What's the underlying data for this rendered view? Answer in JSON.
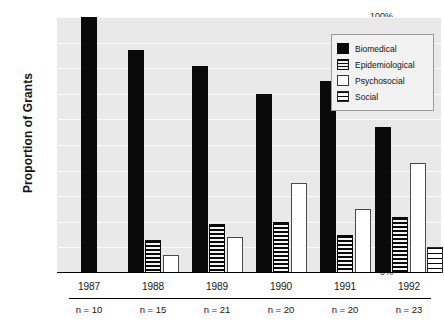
{
  "chart_data": {
    "type": "bar",
    "title": "",
    "subtitle": "",
    "xlabel": "",
    "ylabel": "Proportion of Grants",
    "ylim": [
      0,
      100
    ],
    "yticks": [
      "0%",
      "10%",
      "20%",
      "30%",
      "40%",
      "50%",
      "60%",
      "70%",
      "80%",
      "90%",
      "100%"
    ],
    "ytick_values": [
      0,
      10,
      20,
      30,
      40,
      50,
      60,
      70,
      80,
      90,
      100
    ],
    "grid": true,
    "legend_position": "top-right",
    "categories": [
      "1987",
      "1988",
      "1989",
      "1990",
      "1991",
      "1992"
    ],
    "group_annotations": [
      "n = 10",
      "n = 15",
      "n = 21",
      "n = 20",
      "n = 20",
      "n = 23"
    ],
    "series": [
      {
        "name": "Biomedical",
        "pattern": "solid-black",
        "color": "#0a0a0a",
        "values": [
          100,
          87,
          81,
          70,
          75,
          57
        ]
      },
      {
        "name": "Epidemiological",
        "pattern": "dense-horizontal-hatch",
        "color": "#0a0a0a",
        "values": [
          0,
          13,
          19,
          20,
          15,
          22
        ]
      },
      {
        "name": "Psychosocial",
        "pattern": "white-fill",
        "color": "#ffffff",
        "values": [
          0,
          7,
          14,
          35,
          25,
          43
        ]
      },
      {
        "name": "Social",
        "pattern": "sparse-horizontal-hatch",
        "color": "#ffffff",
        "values": [
          0,
          0,
          0,
          0,
          0,
          10
        ]
      }
    ]
  }
}
